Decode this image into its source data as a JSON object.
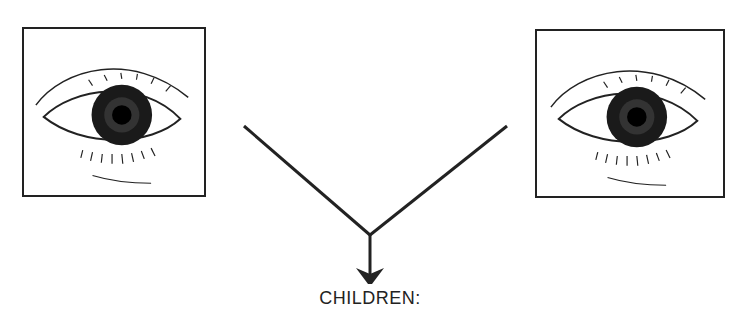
{
  "figure": {
    "left_image": {
      "icon": "eye-icon",
      "description": "eye drawing"
    },
    "right_image": {
      "icon": "eye-icon",
      "description": "eye drawing"
    },
    "connector": {
      "type": "merge-arrow",
      "direction": "down"
    },
    "result_label": "CHILDREN:"
  },
  "colors": {
    "ink": "#222222",
    "background": "#ffffff"
  }
}
